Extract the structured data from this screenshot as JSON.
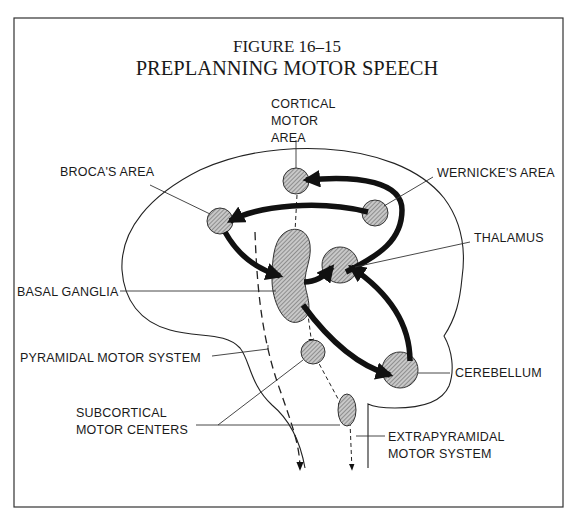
{
  "figure": {
    "number": "FIGURE 16–15",
    "title": "PREPLANNING MOTOR SPEECH"
  },
  "labels": {
    "cortical_motor_area": [
      "CORTICAL",
      "MOTOR",
      "AREA"
    ],
    "brocas_area": "BROCA'S AREA",
    "wernickes_area": "WERNICKE'S AREA",
    "thalamus": "THALAMUS",
    "basal_ganglia": "BASAL GANGLIA",
    "pyramidal_motor_system": "PYRAMIDAL MOTOR SYSTEM",
    "cerebellum": "CEREBELLUM",
    "subcortical_motor_centers": [
      "SUBCORTICAL",
      "MOTOR CENTERS"
    ],
    "extrapyramidal_motor_system": [
      "EXTRAPYRAMIDAL",
      "MOTOR SYSTEM"
    ]
  },
  "colors": {
    "ink": "#1a1a1a",
    "region_fill": "#bdbdbd",
    "background": "#ffffff"
  },
  "connections": [
    {
      "from": "Wernicke's area",
      "to": "Cortical motor area",
      "style": "thick-arrow"
    },
    {
      "from": "Wernicke's area",
      "to": "Broca's area",
      "style": "thick-arrow"
    },
    {
      "from": "Broca's area",
      "to": "Basal ganglia",
      "style": "thick-arrow"
    },
    {
      "from": "Basal ganglia",
      "to": "Thalamus",
      "style": "thick-arrow"
    },
    {
      "from": "Thalamus",
      "to": "Cortical motor area (via Wernicke loop)",
      "style": "thick-line"
    },
    {
      "from": "Basal ganglia",
      "to": "Cerebellum",
      "style": "thick-arrow"
    },
    {
      "from": "Cerebellum",
      "to": "Thalamus",
      "style": "thick-arrow"
    },
    {
      "from": "Cortical motor area",
      "to": "Basal ganglia / subcortical",
      "style": "dashed-arrow"
    },
    {
      "from": "Subcortical motor centers",
      "to": "Extrapyramidal motor system",
      "style": "dashed-arrow"
    },
    {
      "from": "Cortex",
      "to": "Pyramidal motor system",
      "style": "dashed-arrow"
    }
  ]
}
